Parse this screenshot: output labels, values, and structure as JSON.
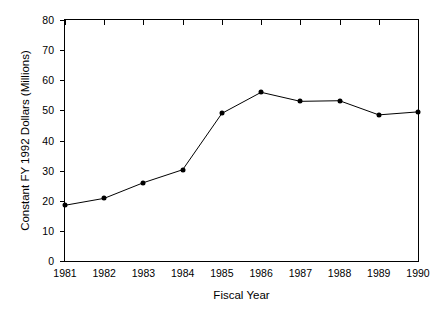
{
  "chart_data": {
    "type": "line",
    "title": "",
    "xlabel": "Fiscal Year",
    "ylabel": "Constant FY 1992 Dollars (Millions)",
    "categories": [
      "1981",
      "1982",
      "1983",
      "1984",
      "1985",
      "1986",
      "1987",
      "1988",
      "1989",
      "1990"
    ],
    "values": [
      18.5,
      20.8,
      26.0,
      30.3,
      49.0,
      56.0,
      53.0,
      53.2,
      48.5,
      49.5
    ],
    "series": [
      {
        "name": "Constant FY 1992 Dollars (Millions)",
        "values": [
          18.5,
          20.8,
          26.0,
          30.3,
          49.0,
          56.0,
          53.0,
          53.2,
          48.5,
          49.5
        ]
      }
    ],
    "xlim": [
      1981,
      1990
    ],
    "ylim": [
      0,
      80
    ],
    "yticks": [
      "0",
      "10",
      "20",
      "30",
      "40",
      "50",
      "60",
      "70",
      "80"
    ],
    "ytick_values": [
      0,
      10,
      20,
      30,
      40,
      50,
      60,
      70,
      80
    ],
    "xticks": [
      "1981",
      "1982",
      "1983",
      "1984",
      "1985",
      "1986",
      "1987",
      "1988",
      "1989",
      "1990"
    ],
    "grid": false,
    "legend": null,
    "marker": "filled-circle",
    "line_color": "#000000",
    "marker_color": "#000000",
    "background_color": "#ffffff",
    "frame_color": "#000000"
  }
}
